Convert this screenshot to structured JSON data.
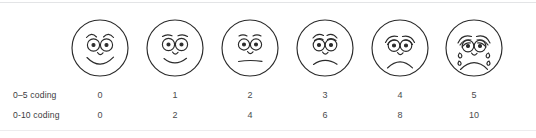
{
  "figure": {
    "name": "faces-pain-rating-scale",
    "ink_color": "#2b2b2b",
    "text_color": "#3b3c3e",
    "rule_color": "#e3e4e6",
    "background": "#ffffff"
  },
  "rows": {
    "row1_label": "0–5 coding",
    "row2_label": "0-10 coding"
  },
  "scale": {
    "faces": [
      {
        "index": 0,
        "expression": "broad-smile",
        "icon": "face-happy-icon",
        "code_0_5": "0",
        "code_0_10": "0",
        "center_x": 100
      },
      {
        "index": 1,
        "expression": "slight-smile",
        "icon": "face-slight-smile-icon",
        "code_0_5": "1",
        "code_0_10": "2",
        "center_x": 175
      },
      {
        "index": 2,
        "expression": "neutral",
        "icon": "face-neutral-icon",
        "code_0_5": "2",
        "code_0_10": "4",
        "center_x": 250
      },
      {
        "index": 3,
        "expression": "slight-frown",
        "icon": "face-slight-frown-icon",
        "code_0_5": "3",
        "code_0_10": "6",
        "center_x": 325
      },
      {
        "index": 4,
        "expression": "frown-sad",
        "icon": "face-sad-icon",
        "code_0_5": "4",
        "code_0_10": "8",
        "center_x": 400
      },
      {
        "index": 5,
        "expression": "crying-with-tears",
        "icon": "face-crying-icon",
        "code_0_5": "5",
        "code_0_10": "10",
        "center_x": 474
      }
    ]
  }
}
